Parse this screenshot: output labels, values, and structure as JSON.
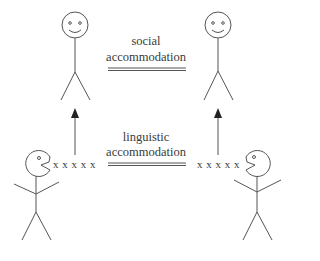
{
  "diagram": {
    "top_label": {
      "line1": "social",
      "line2": "accommodation"
    },
    "bottom_label": {
      "line1": "linguistic",
      "line2": "accommodation"
    },
    "speech_left": "x x x x x",
    "speech_right": "x x x x x",
    "figures": [
      {
        "name": "top-left-person",
        "face": "smiley"
      },
      {
        "name": "top-right-person",
        "face": "smiley"
      },
      {
        "name": "bottom-left-speaker",
        "face": "pacman-mouth-open-right"
      },
      {
        "name": "bottom-right-speaker",
        "face": "pacman-mouth-open-left"
      }
    ],
    "stroke_color": "#555555"
  }
}
